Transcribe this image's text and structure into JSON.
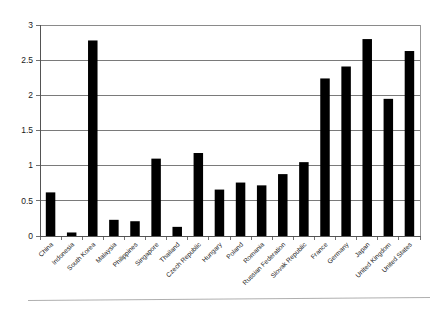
{
  "chart_data": {
    "type": "bar",
    "title": "",
    "xlabel": "",
    "ylabel": "",
    "ylim": [
      0,
      3
    ],
    "yticks": [
      0,
      0.5,
      1,
      1.5,
      2,
      2.5,
      3
    ],
    "ytick_labels": [
      "0",
      "0.5",
      "1",
      "1.5",
      "2",
      "2.5",
      "3"
    ],
    "grid": true,
    "legend": false,
    "legend_position": "none",
    "bar_color": "#000000",
    "categories": [
      "China",
      "Indonesia",
      "South Korea",
      "Malaysia",
      "Philippines",
      "Singapore",
      "Thailand",
      "Czech Republic",
      "Hungary",
      "Poland",
      "Romania",
      "Russian Federation",
      "Slovak Republic",
      "France",
      "Germany",
      "Japan",
      "United Kingdom",
      "United States"
    ],
    "values": [
      0.62,
      0.05,
      2.78,
      0.23,
      0.21,
      1.1,
      0.13,
      1.18,
      0.66,
      0.76,
      0.72,
      0.88,
      1.05,
      2.24,
      2.41,
      2.8,
      1.95,
      2.63
    ]
  }
}
